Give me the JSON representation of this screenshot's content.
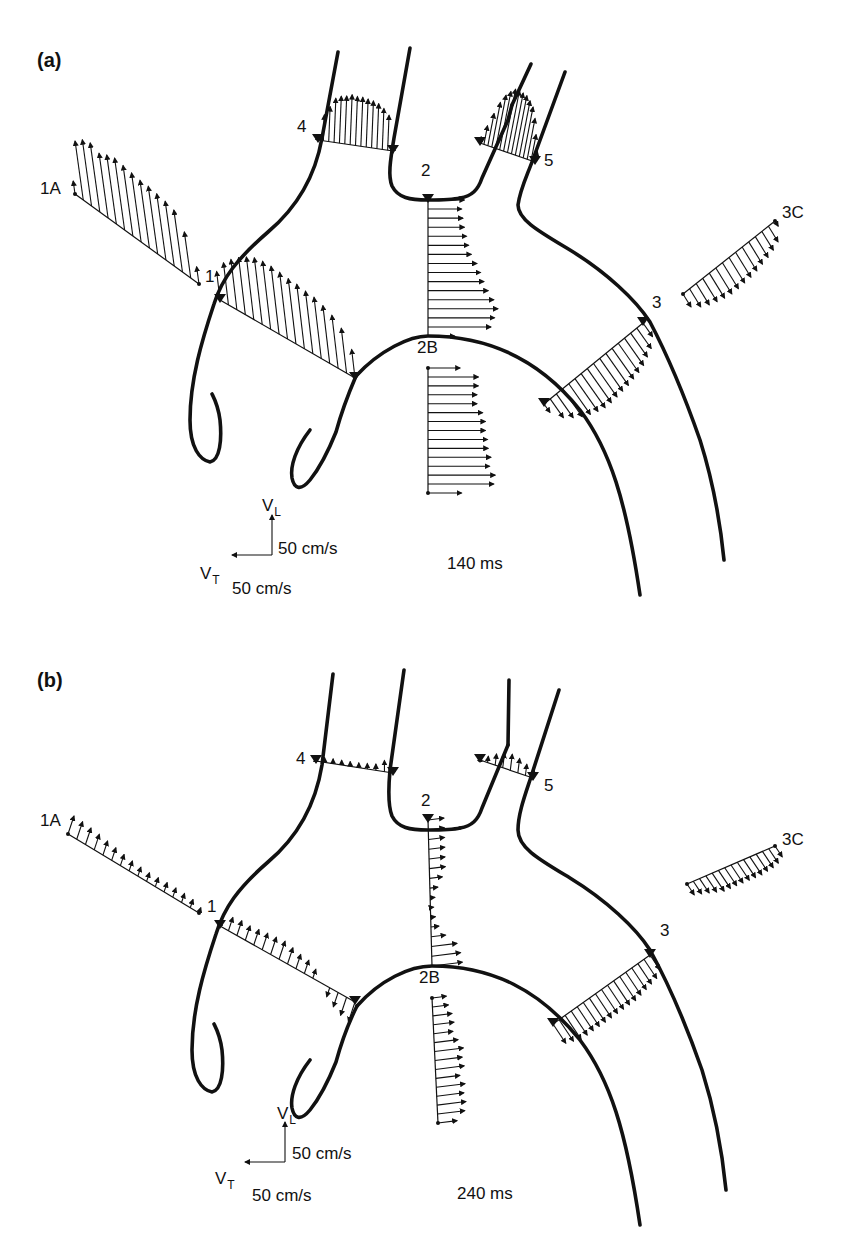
{
  "figure": {
    "colors": {
      "ink": "#111111",
      "background": "#ffffff"
    },
    "panels": [
      {
        "id": "a",
        "label": "(a)",
        "time": "140 ms",
        "scale": {
          "vl_label": "V",
          "vl_sub": "L",
          "vt_label": "V",
          "vt_sub": "T",
          "vl_value": "50 cm/s",
          "vt_value": "50 cm/s"
        },
        "station_labels": [
          {
            "text": "1A",
            "x": 40,
            "y": 188
          },
          {
            "text": "1",
            "x": 205,
            "y": 276
          },
          {
            "text": "4",
            "x": 297,
            "y": 126
          },
          {
            "text": "2",
            "x": 421,
            "y": 170
          },
          {
            "text": "5",
            "x": 544,
            "y": 160
          },
          {
            "text": "3C",
            "x": 782,
            "y": 212
          },
          {
            "text": "3",
            "x": 652,
            "y": 302
          },
          {
            "text": "2B",
            "x": 417,
            "y": 347
          }
        ],
        "vessels": [
          "M338 52 L322 138 C316 172 300 205 268 232 C238 258 222 278 214 304 C202 340 190 380 190 420 C190 448 200 460 210 462 C220 460 222 440 220 420 C218 405 214 398 212 394",
          "M410 48 L394 138 C390 162 388 176 392 186 C398 198 410 200 428 200 C440 200 452 200 460 198",
          "M460 198 C472 196 478 190 482 178 L508 120 L512 105",
          "M512 105 L531 64",
          "M565 72 L532 162 C526 178 520 190 518 205 C518 220 540 232 570 250 C606 272 636 300 650 322 C670 360 686 400 700 440 C712 478 720 520 724 560",
          "M356 376 C350 390 342 410 336 432 C328 452 318 470 310 480 C300 492 294 488 292 478 C290 466 296 448 310 430",
          "M356 376 C380 350 410 336 428 336 C490 336 540 360 580 410 C610 450 626 500 640 595"
        ],
        "sections": [
          {
            "id": "1A",
            "x1": 75,
            "y1": 194,
            "x2": 199,
            "y2": 284,
            "dots": true,
            "vectors": {
              "dx": -10,
              "dy": -72,
              "lengths": [
                0.18,
                0.82,
                0.92,
                0.96,
                0.9,
                0.96,
                1.0,
                0.98,
                0.96,
                0.94,
                0.94,
                0.92,
                0.9,
                0.86,
                0.64,
                0.24
              ]
            }
          },
          {
            "id": "1",
            "x1": 220,
            "y1": 300,
            "x2": 355,
            "y2": 378,
            "markers": [
              [
                220,
                300
              ],
              [
                355,
                378
              ]
            ],
            "vectors": {
              "dx": -8,
              "dy": -68,
              "lengths": [
                0.42,
                0.62,
                0.74,
                0.84,
                0.92,
                0.98,
                1.0,
                1.0,
                0.98,
                0.96,
                0.95,
                0.92,
                0.9,
                0.85,
                0.78,
                0.66,
                0.42
              ]
            }
          },
          {
            "id": "4",
            "x1": 318,
            "y1": 140,
            "x2": 393,
            "y2": 151,
            "markers": [
              [
                318,
                140
              ],
              [
                393,
                151
              ]
            ],
            "vectors": {
              "dx": 2,
              "dy": -50,
              "lengths": [
                0.1,
                0.52,
                0.7,
                0.88,
                0.94,
                0.96,
                1.0,
                0.98,
                0.98,
                0.96,
                0.94,
                0.9,
                0.82,
                0.7,
                0.1
              ]
            }
          },
          {
            "id": "5",
            "x1": 480,
            "y1": 143,
            "x2": 535,
            "y2": 162,
            "markers": [
              [
                480,
                143
              ],
              [
                535,
                162
              ]
            ],
            "vectors": {
              "dx": 12,
              "dy": -62,
              "lengths": [
                0.1,
                0.3,
                0.52,
                0.72,
                0.86,
                0.94,
                1.0,
                1.0,
                0.98,
                0.96,
                0.9,
                0.82,
                0.66,
                0.42,
                0.18
              ]
            }
          },
          {
            "id": "2",
            "x1": 428,
            "y1": 200,
            "x2": 428,
            "y2": 336,
            "markers": [
              [
                428,
                200
              ]
            ],
            "vectors": {
              "dx": 70,
              "dy": 0,
              "lengths": [
                0.52,
                0.48,
                0.5,
                0.52,
                0.55,
                0.58,
                0.62,
                0.7,
                0.75,
                0.8,
                0.86,
                0.94,
                1.0,
                0.95,
                0.9,
                0.38
              ]
            }
          },
          {
            "id": "2B",
            "x1": 428,
            "y1": 368,
            "x2": 428,
            "y2": 493,
            "dots": true,
            "vectors": {
              "dx": 70,
              "dy": 0,
              "lengths": [
                0.46,
                0.72,
                0.72,
                0.7,
                0.7,
                0.78,
                0.82,
                0.82,
                0.85,
                0.86,
                0.9,
                0.88,
                0.96,
                0.94,
                0.48
              ]
            }
          },
          {
            "id": "3",
            "x1": 544,
            "y1": 404,
            "x2": 643,
            "y2": 323,
            "markers": [
              [
                544,
                404
              ],
              [
                643,
                323
              ]
            ],
            "vectors": {
              "dx": 24,
              "dy": 34,
              "lengths": [
                0.25,
                0.55,
                0.7,
                0.82,
                0.9,
                0.96,
                1.0,
                1.0,
                0.98,
                0.96,
                0.94,
                0.9,
                0.86,
                0.8,
                0.7,
                0.6,
                0.4
              ]
            }
          },
          {
            "id": "3C",
            "x1": 683,
            "y1": 294,
            "x2": 775,
            "y2": 221,
            "dots": true,
            "vectors": {
              "dx": 16,
              "dy": 26,
              "lengths": [
                0.5,
                0.7,
                0.82,
                0.9,
                0.96,
                1.0,
                1.0,
                0.98,
                0.96,
                0.92,
                0.86,
                0.8,
                0.72,
                0.6,
                0.2
              ]
            }
          }
        ],
        "scale_bar": {
          "x": 272,
          "y": 555,
          "h": 40,
          "w": 40
        }
      },
      {
        "id": "b",
        "label": "(b)",
        "time": "240 ms",
        "scale": {
          "vl_label": "V",
          "vl_sub": "L",
          "vt_label": "V",
          "vt_sub": "T",
          "vl_value": "50 cm/s",
          "vt_value": "50 cm/s"
        },
        "station_labels": [
          {
            "text": "1A",
            "x": 40,
            "y": 190
          },
          {
            "text": "1",
            "x": 207,
            "y": 276
          },
          {
            "text": "4",
            "x": 296,
            "y": 128
          },
          {
            "text": "2",
            "x": 421,
            "y": 170
          },
          {
            "text": "5",
            "x": 544,
            "y": 155
          },
          {
            "text": "3C",
            "x": 782,
            "y": 209
          },
          {
            "text": "3",
            "x": 660,
            "y": 300
          },
          {
            "text": "2B",
            "x": 419,
            "y": 347
          }
        ],
        "vessels": [
          "M333 44 L322 135 C316 172 300 205 268 232 C238 258 224 278 216 304 C204 340 192 380 192 420 C192 448 202 460 212 462 C222 460 224 440 222 420 C220 405 216 398 214 394",
          "M404 40 L390 140 C388 162 388 176 392 186 C398 198 410 200 428 200 C440 200 452 200 460 198",
          "M460 198 C472 196 478 190 482 178 L508 115",
          "M508 115 L509 50",
          "M559 60 L530 150 C524 168 518 185 518 200 C518 218 540 230 570 248 C606 270 636 298 650 320 C672 360 688 400 702 440 C714 478 722 520 726 560",
          "M357 376 C350 390 342 410 336 432 C328 452 318 470 310 480 C300 492 294 488 292 478 C290 466 296 448 310 430",
          "M357 376 C380 350 410 336 432 336 C492 336 540 360 580 410 C610 450 626 500 640 595"
        ],
        "sections": [
          {
            "id": "1A",
            "x1": 68,
            "y1": 204,
            "x2": 199,
            "y2": 283,
            "dots": true,
            "vectors": {
              "dx": 6,
              "dy": -18,
              "lengths": [
                1.0,
                0.98,
                0.92,
                0.86,
                0.78,
                0.7,
                0.62,
                0.55,
                0.5,
                0.48,
                0.5,
                0.52,
                0.52,
                0.5,
                0.46,
                0.3
              ]
            }
          },
          {
            "id": "1",
            "x1": 220,
            "y1": 296,
            "x2": 355,
            "y2": 372,
            "markers": [
              [
                220,
                296
              ],
              [
                355,
                372
              ]
            ],
            "vectors": {
              "dx": 6,
              "dy": -18,
              "lengths": [
                0.28,
                0.74,
                0.82,
                0.8,
                0.86,
                0.92,
                0.96,
                1.0,
                0.9,
                0.8,
                0.74,
                0.5,
                0.0,
                -0.5,
                -0.8,
                -1.0,
                -1.1
              ]
            }
          },
          {
            "id": "4",
            "x1": 316,
            "y1": 131,
            "x2": 393,
            "y2": 143,
            "markers": [
              [
                316,
                131
              ],
              [
                393,
                143
              ]
            ],
            "vectors": {
              "dx": 0,
              "dy": -8,
              "lengths": [
                0.5,
                0.6,
                0.6,
                0.6,
                0.6,
                0.6,
                0.7,
                0.8,
                1.4,
                0.7
              ]
            }
          },
          {
            "id": "5",
            "x1": 480,
            "y1": 130,
            "x2": 533,
            "y2": 148,
            "markers": [
              [
                480,
                130
              ],
              [
                533,
                148
              ]
            ],
            "vectors": {
              "dx": 2,
              "dy": -16,
              "lengths": [
                0.2,
                0.4,
                0.7,
                0.9,
                1.0,
                0.9,
                0.7,
                0.5
              ]
            }
          },
          {
            "id": "2",
            "x1": 428,
            "y1": 190,
            "x2": 432,
            "y2": 336,
            "markers": [
              [
                428,
                190
              ]
            ],
            "vectors": {
              "dx": 16,
              "dy": -2,
              "lengths": [
                1.0,
                1.0,
                1.0,
                1.0,
                1.0,
                1.0,
                0.8,
                0.5,
                0.3,
                0.2,
                0.3,
                0.5,
                0.9,
                1.6,
                1.8,
                1.9
              ]
            }
          },
          {
            "id": "2B",
            "x1": 432,
            "y1": 368,
            "x2": 438,
            "y2": 493,
            "dots": true,
            "vectors": {
              "dx": 16,
              "dy": -2,
              "lengths": [
                0.9,
                1.0,
                1.2,
                1.3,
                1.2,
                1.5,
                1.8,
                1.7,
                1.8,
                1.5,
                1.8,
                1.7,
                1.8,
                1.7,
                1.2
              ]
            }
          },
          {
            "id": "3",
            "x1": 553,
            "y1": 394,
            "x2": 650,
            "y2": 325,
            "markers": [
              [
                553,
                394
              ],
              [
                650,
                325
              ]
            ],
            "vectors": {
              "dx": 16,
              "dy": 24,
              "lengths": [
                0.8,
                0.9,
                1.0,
                1.0,
                1.0,
                1.0,
                1.0,
                1.0,
                1.0,
                1.0,
                1.0,
                1.0,
                0.95,
                0.9,
                0.85,
                0.8,
                0.6
              ]
            }
          },
          {
            "id": "3C",
            "x1": 687,
            "y1": 254,
            "x2": 775,
            "y2": 216,
            "dots": true,
            "vectors": {
              "dx": 12,
              "dy": 18,
              "lengths": [
                0.6,
                0.7,
                0.8,
                0.9,
                1.0,
                1.0,
                1.0,
                1.0,
                1.0,
                1.0,
                1.0,
                0.95,
                0.9,
                0.8,
                0.6
              ]
            }
          }
        ],
        "scale_bar": {
          "x": 285,
          "y": 532,
          "h": 40,
          "w": 40
        }
      }
    ]
  }
}
